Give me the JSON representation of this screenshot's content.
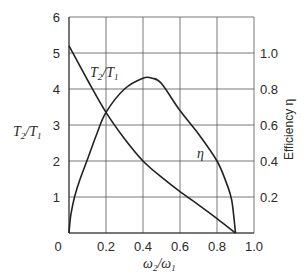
{
  "chart_data": {
    "type": "line",
    "title": "",
    "xlabel": "ω2/ω1",
    "ylabel_left": "T2/T1",
    "ylabel_right": "Efficiency η",
    "xlim": [
      0,
      1.0
    ],
    "ylim_left": [
      0,
      6
    ],
    "ylim_right": [
      0,
      1.2
    ],
    "grid": true,
    "x_ticks": [
      "0",
      "0.2",
      "0.4",
      "0.6",
      "0.8",
      "1.0"
    ],
    "y_ticks_left": [
      "0",
      "1",
      "2",
      "3",
      "4",
      "5",
      "6"
    ],
    "y_ticks_right": [
      "0.2",
      "0.4",
      "0.6",
      "0.8",
      "1.0"
    ],
    "series": [
      {
        "name": "T2/T1",
        "axis": "left",
        "label": "T2/T1",
        "x": [
          0.0,
          0.1,
          0.2,
          0.3,
          0.4,
          0.5,
          0.6,
          0.7,
          0.8,
          0.9
        ],
        "values": [
          5.2,
          4.25,
          3.35,
          2.62,
          2.0,
          1.55,
          1.15,
          0.78,
          0.4,
          0.0
        ]
      },
      {
        "name": "η",
        "axis": "right",
        "label": "η",
        "x": [
          0.0,
          0.01,
          0.03,
          0.06,
          0.1,
          0.15,
          0.2,
          0.3,
          0.4,
          0.45,
          0.5,
          0.6,
          0.7,
          0.8,
          0.85,
          0.88,
          0.9
        ],
        "values": [
          0.0,
          0.1,
          0.2,
          0.3,
          0.41,
          0.55,
          0.67,
          0.8,
          0.86,
          0.86,
          0.83,
          0.68,
          0.55,
          0.4,
          0.28,
          0.18,
          0.0
        ]
      }
    ]
  },
  "labels": {
    "x_axis": "ω₂/ω₁",
    "left_axis": "T₂/T₁",
    "right_axis": "Efficiency η",
    "curve_torque": "T₂/T₁",
    "curve_eff": "η"
  }
}
